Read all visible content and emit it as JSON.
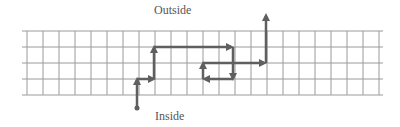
{
  "labels": {
    "outside": "Outside",
    "inside": "Inside"
  },
  "colors": {
    "grid": "#9a9a9a",
    "path": "#5f5f5f",
    "text": "#555555",
    "background": "#ffffff"
  },
  "grid": {
    "x_start": 22,
    "x_end": 383,
    "y_lines": [
      31,
      47,
      63,
      79,
      95
    ],
    "x_spacing": 16,
    "x_first": 27
  },
  "path": {
    "start_dot": [
      137,
      108
    ],
    "segments": [
      {
        "from": [
          137,
          108
        ],
        "to": [
          137,
          80
        ],
        "arrow": true
      },
      {
        "from": [
          137,
          79
        ],
        "to": [
          153,
          79
        ],
        "arrow": true
      },
      {
        "from": [
          154,
          79
        ],
        "to": [
          154,
          48
        ],
        "arrow": true
      },
      {
        "from": [
          154,
          47
        ],
        "to": [
          231,
          47
        ],
        "arrow": true
      },
      {
        "from": [
          233,
          47
        ],
        "to": [
          233,
          78
        ],
        "arrow": true
      },
      {
        "from": [
          233,
          79
        ],
        "to": [
          205,
          79
        ],
        "arrow": true
      },
      {
        "from": [
          203,
          79
        ],
        "to": [
          203,
          64
        ],
        "arrow": true
      },
      {
        "from": [
          203,
          63
        ],
        "to": [
          264,
          63
        ],
        "arrow": true
      },
      {
        "from": [
          266,
          63
        ],
        "to": [
          266,
          16
        ],
        "arrow": true
      }
    ]
  }
}
